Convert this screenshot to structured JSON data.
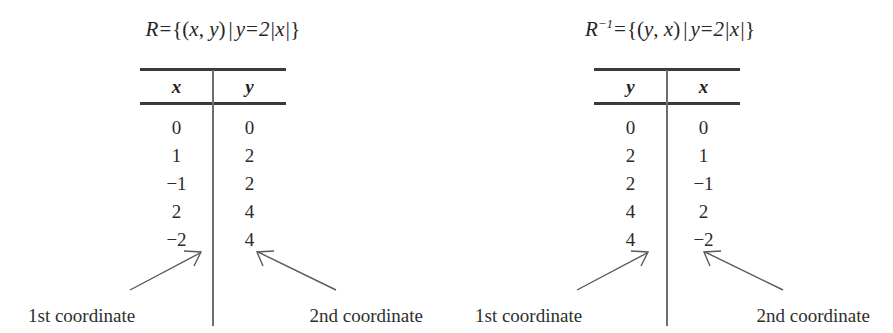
{
  "figure": {
    "panels": [
      {
        "id": "relation",
        "title": {
          "relation_symbol": "R",
          "superscript": "",
          "equals": "=",
          "set_open": "{(",
          "first_var": "x",
          "comma": ", ",
          "second_var": "y",
          "paren_close": ")",
          "such_that": "|",
          "condition_lhs": "y",
          "condition_eq": "=",
          "condition_rhs": "2|x|",
          "set_close": "}",
          "full_text": "R = {(x, y) | y = 2|x|}"
        },
        "table": {
          "headers": [
            "x",
            "y"
          ],
          "rows": [
            [
              "0",
              "0"
            ],
            [
              "1",
              "2"
            ],
            [
              "−1",
              "2"
            ],
            [
              "2",
              "4"
            ],
            [
              "−2",
              "4"
            ]
          ]
        },
        "annotations": {
          "first_coordinate_label": "1st coordinate",
          "second_coordinate_label": "2nd coordinate"
        }
      },
      {
        "id": "inverse-relation",
        "title": {
          "relation_symbol": "R",
          "superscript": "−1",
          "equals": "=",
          "set_open": "{(",
          "first_var": "y",
          "comma": ", ",
          "second_var": "x",
          "paren_close": ")",
          "such_that": "|",
          "condition_lhs": "y",
          "condition_eq": "=",
          "condition_rhs": "2|x|",
          "set_close": "}",
          "full_text": "R⁻¹ = {(y, x) | y = 2|x|}"
        },
        "table": {
          "headers": [
            "y",
            "x"
          ],
          "rows": [
            [
              "0",
              "0"
            ],
            [
              "2",
              "1"
            ],
            [
              "2",
              "−1"
            ],
            [
              "4",
              "2"
            ],
            [
              "4",
              "−2"
            ]
          ]
        },
        "annotations": {
          "first_coordinate_label": "1st coordinate",
          "second_coordinate_label": "2nd coordinate"
        }
      }
    ],
    "colors": {
      "background": "#ffffff",
      "text": "#2b2b2b",
      "rule": "#3a3a3a",
      "divider": "#6e6e6e",
      "arrow": "#5a5a5a"
    }
  }
}
